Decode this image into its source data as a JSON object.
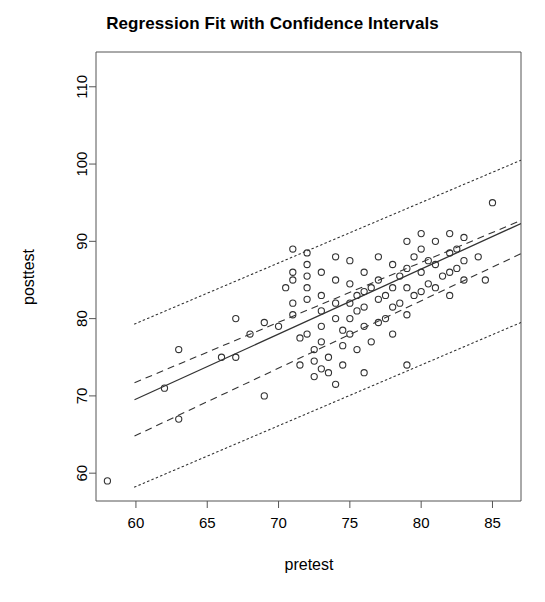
{
  "chart_data": {
    "type": "scatter",
    "title": "Regression Fit with Confidence Intervals",
    "xlabel": "pretest",
    "ylabel": "posttest",
    "xlim": [
      57.2,
      87.0
    ],
    "ylim": [
      56.4,
      114.5
    ],
    "xticks": [
      60,
      65,
      70,
      75,
      80,
      85
    ],
    "yticks": [
      60,
      70,
      80,
      90,
      100,
      110
    ],
    "grid": false,
    "legend": "none",
    "box": "open-L-frame",
    "point_marker": "open-circle",
    "point_color": "#333333",
    "line_color": "#333333",
    "series": [
      {
        "name": "observations",
        "type": "scatter",
        "x": [
          58.0,
          62.0,
          63.0,
          63.0,
          66.0,
          67.0,
          67.0,
          68.0,
          69.0,
          69.0,
          70.0,
          70.5,
          71.0,
          71.0,
          71.0,
          71.0,
          71.0,
          71.5,
          71.5,
          72.0,
          72.0,
          72.0,
          72.0,
          72.0,
          72.5,
          72.5,
          72.5,
          73.0,
          73.0,
          73.0,
          73.0,
          73.0,
          73.5,
          73.5,
          74.0,
          74.0,
          74.0,
          74.0,
          74.5,
          74.5,
          74.5,
          75.0,
          75.0,
          75.0,
          75.0,
          75.0,
          75.5,
          75.5,
          75.5,
          76.0,
          76.0,
          76.0,
          76.0,
          76.5,
          76.5,
          77.0,
          77.0,
          77.0,
          77.0,
          77.5,
          77.5,
          78.0,
          78.0,
          78.0,
          78.0,
          78.5,
          78.5,
          79.0,
          79.0,
          79.0,
          79.0,
          79.5,
          79.5,
          80.0,
          80.0,
          80.0,
          80.5,
          80.5,
          81.0,
          81.0,
          81.0,
          81.5,
          82.0,
          82.0,
          82.0,
          82.0,
          82.5,
          82.5,
          83.0,
          83.0,
          83.0,
          84.0,
          84.5,
          85.0,
          79.0,
          76.0,
          74.0,
          73.0,
          72.0,
          80.0
        ],
        "y": [
          59.0,
          71.0,
          76.0,
          67.0,
          75.0,
          80.0,
          75.0,
          78.0,
          70.0,
          79.5,
          79.0,
          84.0,
          89.0,
          86.0,
          85.0,
          82.0,
          80.5,
          77.5,
          74.0,
          87.0,
          85.5,
          84.0,
          82.5,
          78.0,
          76.0,
          74.5,
          72.5,
          86.0,
          83.0,
          81.0,
          79.0,
          77.0,
          75.0,
          73.0,
          88.0,
          85.0,
          82.0,
          80.0,
          78.5,
          76.5,
          74.0,
          87.5,
          84.5,
          82.0,
          80.0,
          78.0,
          83.0,
          81.0,
          76.0,
          86.0,
          83.5,
          81.5,
          79.0,
          84.0,
          77.0,
          88.0,
          85.0,
          82.5,
          79.5,
          83.0,
          80.0,
          87.0,
          84.0,
          81.5,
          78.0,
          85.5,
          82.0,
          90.0,
          86.5,
          84.0,
          80.5,
          88.0,
          83.0,
          89.0,
          86.0,
          83.5,
          87.5,
          84.5,
          90.0,
          87.0,
          84.0,
          85.5,
          91.0,
          88.5,
          86.0,
          83.0,
          89.0,
          86.5,
          90.5,
          87.5,
          85.0,
          88.0,
          85.0,
          95.0,
          74.0,
          73.0,
          71.5,
          73.5,
          88.5,
          91.0
        ]
      },
      {
        "name": "regression fit",
        "type": "line",
        "style": "solid",
        "x": [
          59.9,
          87.0
        ],
        "y": [
          69.5,
          92.3
        ]
      },
      {
        "name": "confidence interval upper",
        "type": "line",
        "style": "dashed",
        "x": [
          59.9,
          87.0
        ],
        "y": [
          71.7,
          92.7
        ]
      },
      {
        "name": "confidence interval lower",
        "type": "line",
        "style": "dashed",
        "x": [
          59.9,
          87.0
        ],
        "y": [
          64.8,
          88.4
        ]
      },
      {
        "name": "prediction interval upper",
        "type": "line",
        "style": "dotted",
        "x": [
          59.9,
          87.0
        ],
        "y": [
          79.3,
          100.5
        ]
      },
      {
        "name": "prediction interval lower",
        "type": "line",
        "style": "dotted",
        "x": [
          59.9,
          87.0
        ],
        "y": [
          58.2,
          79.5
        ]
      }
    ]
  }
}
